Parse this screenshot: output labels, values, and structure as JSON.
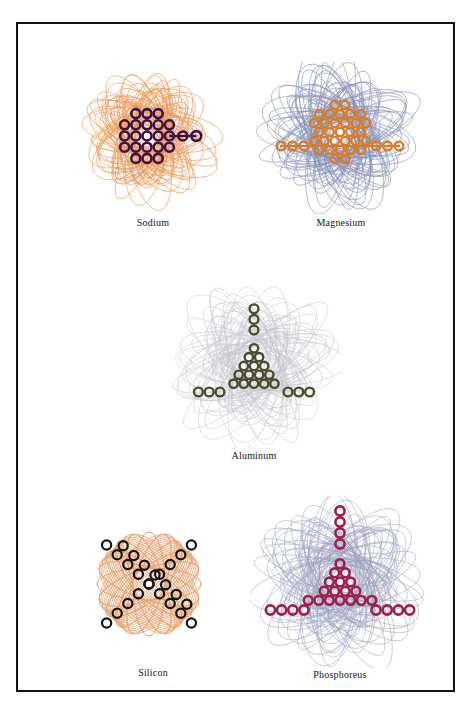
{
  "page": {
    "background_color": "#ffffff",
    "frame": {
      "border_color": "#111111",
      "border_width_px": 2.5
    }
  },
  "figures": [
    {
      "id": "sodium",
      "caption": "Sodium",
      "core_color": "#3B1048",
      "orbit_color": "#E8883A",
      "orbit_opacity": 0.75,
      "core_shape": "cubic-cluster-with-right-arm",
      "orbit_style": "dense-elliptical-rosette",
      "orbit_count": 44,
      "core_ring_count": 14,
      "arm_ring_count": 2,
      "cloud_width": 150,
      "cloud_height": 140
    },
    {
      "id": "magnesium",
      "caption": "Magnesium",
      "core_color": "#D97B22",
      "orbit_color": "#7A85AE",
      "orbit_opacity": 0.8,
      "core_shape": "spherical-cluster-with-two-horizontal-arms",
      "orbit_style": "petal-rosette",
      "orbit_count": 48,
      "core_ring_count": 34,
      "arm_ring_count": 6,
      "cloud_width": 160,
      "cloud_height": 150
    },
    {
      "id": "aluminum",
      "caption": "Aluminum",
      "core_color": "#4A4A2E",
      "orbit_color": "#A9AAB4",
      "orbit_opacity": 0.55,
      "core_shape": "triangular-cluster-with-three-arms",
      "orbit_style": "faint-petal-rosette",
      "orbit_count": 46,
      "core_ring_count": 28,
      "arm_ring_count": 7,
      "cloud_width": 166,
      "cloud_height": 160
    },
    {
      "id": "silicon",
      "caption": "Silicon",
      "core_color": "#141414",
      "orbit_color": "#E39155",
      "orbit_opacity": 0.85,
      "core_shape": "double-diagonal-chain-lattice",
      "orbit_style": "square-diamond-lattice",
      "orbit_count": 40,
      "core_ring_count": 22,
      "arm_ring_count": 0,
      "cloud_width": 140,
      "cloud_height": 140
    },
    {
      "id": "phosphoreus",
      "caption": "Phosphoreus",
      "core_color": "#9B2050",
      "orbit_color": "#8A90B2",
      "orbit_opacity": 0.7,
      "core_shape": "triangular-cluster-with-three-arms",
      "orbit_style": "petal-rosette",
      "orbit_count": 50,
      "core_ring_count": 30,
      "arm_ring_count": 10,
      "cloud_width": 176,
      "cloud_height": 170
    }
  ]
}
